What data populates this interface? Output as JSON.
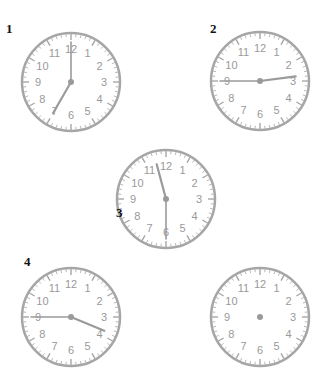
{
  "colors": {
    "face_stroke": "#a6a6a6",
    "numerals": "#999999",
    "hands": "#9a9a9a",
    "label": "#111111"
  },
  "numerals": [
    "12",
    "1",
    "2",
    "3",
    "4",
    "5",
    "6",
    "7",
    "8",
    "9",
    "10",
    "11"
  ],
  "clocks": [
    {
      "label": "1",
      "cx": 71,
      "cy": 82,
      "r": 49,
      "hour": 7,
      "minute": 0,
      "show_hands": true,
      "label_x": 6,
      "label_y": 33
    },
    {
      "label": "2",
      "cx": 260,
      "cy": 81,
      "r": 49,
      "hour": 2,
      "minute": 45,
      "show_hands": true,
      "label_x": 210,
      "label_y": 33
    },
    {
      "label": "3",
      "cx": 166,
      "cy": 199,
      "r": 49,
      "hour": 11,
      "minute": 30,
      "show_hands": true,
      "label_x": 116,
      "label_y": 217
    },
    {
      "label": "4",
      "cx": 71,
      "cy": 317,
      "r": 49,
      "hour": 3,
      "minute": 45,
      "show_hands": true,
      "label_x": 24,
      "label_y": 266
    },
    {
      "label": "",
      "cx": 260,
      "cy": 317,
      "r": 49,
      "hour": null,
      "minute": null,
      "show_hands": false,
      "label_x": 0,
      "label_y": 0
    }
  ]
}
